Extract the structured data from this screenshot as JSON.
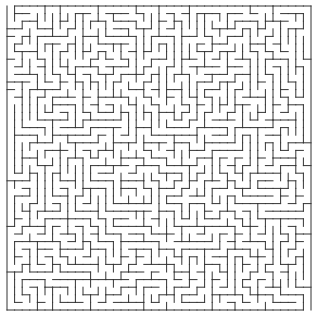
{
  "maze": {
    "cols": 40,
    "rows": 40,
    "origin_x": 7,
    "origin_y": 6,
    "cell_size": 7.6,
    "wall_color": "#333333",
    "background": "#ffffff",
    "wall_width": 1,
    "seed": 9137,
    "entrance": {
      "side": "top",
      "col": 0
    },
    "exit": {
      "side": "bottom",
      "col": 39
    }
  }
}
